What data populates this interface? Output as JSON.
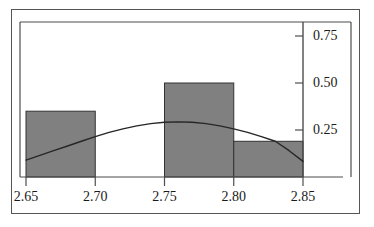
{
  "chart_data": {
    "type": "bar",
    "title": "",
    "subtitle": "",
    "xlabel": "",
    "ylabel": "",
    "xlim": [
      2.65,
      2.85
    ],
    "ylim": [
      0,
      0.85
    ],
    "grid": false,
    "legend": null,
    "xticks": [
      "2.65",
      "2.70",
      "2.75",
      "2.80",
      "2.85"
    ],
    "xtick_values": [
      2.65,
      2.7,
      2.75,
      2.8,
      2.85
    ],
    "yticks": [
      "0.25",
      "0.50",
      "0.75"
    ],
    "ytick_values": [
      0.25,
      0.5,
      0.75
    ],
    "bin_edges": [
      2.65,
      2.7,
      2.75,
      2.8,
      2.85
    ],
    "categories": [
      "2.65-2.70",
      "2.70-2.75",
      "2.75-2.80",
      "2.80-2.85"
    ],
    "values": [
      0.35,
      0.0,
      0.5,
      0.19
    ],
    "bar_color": "#808080",
    "bar_edge_color": "#333333",
    "axis_color": "#4d4d4d",
    "curve_color": "#262626",
    "curve": {
      "name": "fitted normal density curve",
      "x": [
        2.65,
        2.66,
        2.67,
        2.68,
        2.69,
        2.7,
        2.71,
        2.72,
        2.73,
        2.74,
        2.75,
        2.76,
        2.77,
        2.78,
        2.79,
        2.8,
        2.81,
        2.82,
        2.83,
        2.84,
        2.85
      ],
      "y": [
        0.09,
        0.115,
        0.14,
        0.165,
        0.19,
        0.215,
        0.237,
        0.256,
        0.272,
        0.284,
        0.291,
        0.293,
        0.291,
        0.284,
        0.272,
        0.256,
        0.237,
        0.215,
        0.19,
        0.14,
        0.083
      ]
    }
  },
  "axes": {
    "x_axis_name": "x-axis",
    "y_axis_name": "y-axis"
  }
}
